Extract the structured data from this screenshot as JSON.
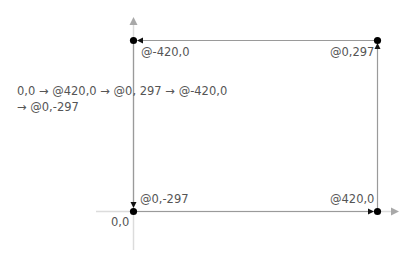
{
  "description": {
    "line1": "0,0 → @420,0 → @0, 297 → @-420,0",
    "line2": "→ @0,-297"
  },
  "points": {
    "origin": {
      "label": "0,0"
    },
    "p1": {
      "label": "@420,0"
    },
    "p2": {
      "label": "@0,297"
    },
    "p3": {
      "label": "@-420,0"
    },
    "p4": {
      "label": "@0,-297"
    }
  },
  "colors": {
    "axis": "#c8c8c8",
    "axis_arrow": "#a0a0a0",
    "path": "#999999",
    "point": "#000000",
    "text": "#555555"
  }
}
